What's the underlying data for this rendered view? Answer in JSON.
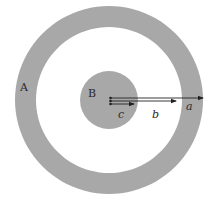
{
  "diagram": {
    "labels": {
      "outer_shell": "A",
      "inner_sphere": "B",
      "radius_a": "a",
      "radius_b": "b",
      "radius_c": "c"
    },
    "colors": {
      "shell_fill": "#a8a8a8",
      "background": "#ffffff",
      "line": "#222222"
    },
    "geometry": {
      "center": [
        109,
        100
      ],
      "outer_shell_outer_radius": 94,
      "outer_shell_inner_radius": 73,
      "inner_sphere_radius": 29
    }
  }
}
